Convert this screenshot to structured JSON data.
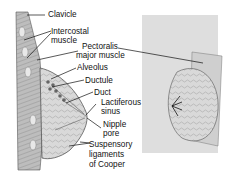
{
  "figure": {
    "views": [
      "sagittal-section",
      "frontal-cutaway"
    ]
  },
  "labels": {
    "clavicle": "Clavicle",
    "intercostal_1": "Intercostal",
    "intercostal_2": "muscle",
    "pectoralis_1": "Pectoralis",
    "pectoralis_2": "major muscle",
    "alveolus": "Alveolus",
    "ductule": "Ductule",
    "duct": "Duct",
    "lactiferous_1": "Lactiferous",
    "lactiferous_2": "sinus",
    "nipple_1": "Nipple",
    "nipple_2": "pore",
    "suspensory_1": "Suspensory",
    "suspensory_2": "ligaments",
    "suspensory_3": "of Cooper"
  }
}
